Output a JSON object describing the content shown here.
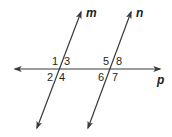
{
  "diagram": {
    "colors": {
      "line": "#3a3a3a",
      "text": "#231f20",
      "background": "#ffffff"
    },
    "lines": [
      {
        "name": "m",
        "label": "m",
        "x1": 37,
        "y1": 128,
        "x2": 81,
        "y2": 12,
        "label_x": 86,
        "label_y": 17
      },
      {
        "name": "n",
        "label": "n",
        "x1": 88,
        "y1": 128,
        "x2": 131,
        "y2": 12,
        "label_x": 136,
        "label_y": 17
      },
      {
        "name": "p",
        "label": "p",
        "x1": 15,
        "y1": 69,
        "x2": 160,
        "y2": 69,
        "label_x": 157,
        "label_y": 84
      }
    ],
    "angles": [
      {
        "label": "1",
        "x": 52,
        "y": 65
      },
      {
        "label": "3",
        "x": 64,
        "y": 65
      },
      {
        "label": "2",
        "x": 47,
        "y": 81
      },
      {
        "label": "4",
        "x": 59,
        "y": 81
      },
      {
        "label": "5",
        "x": 103,
        "y": 65
      },
      {
        "label": "8",
        "x": 116,
        "y": 65
      },
      {
        "label": "6",
        "x": 98,
        "y": 81
      },
      {
        "label": "7",
        "x": 112,
        "y": 81
      }
    ]
  }
}
